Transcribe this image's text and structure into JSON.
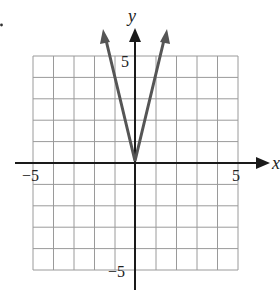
{
  "chart_data": {
    "type": "line",
    "title": "",
    "xlabel": "x",
    "ylabel": "y",
    "xlim": [
      -5,
      5
    ],
    "ylim": [
      -5,
      5
    ],
    "grid": true,
    "x_ticks": [
      {
        "value": -5,
        "label": "−5"
      },
      {
        "value": 5,
        "label": "5"
      }
    ],
    "y_ticks": [
      {
        "value": 5,
        "label": "5"
      },
      {
        "value": -5,
        "label": "−5"
      }
    ],
    "series": [
      {
        "name": "y = 4|x|",
        "points": [
          [
            -1.6,
            6.4
          ],
          [
            0,
            0
          ],
          [
            1.6,
            6.4
          ]
        ],
        "arrows": "both-ends-up"
      }
    ],
    "colors": {
      "grid": "#9a9a9a",
      "axis": "#1a1a1a",
      "series": "#555555"
    }
  },
  "labels": {
    "x_axis": "x",
    "y_axis": "y",
    "x_min": "−5",
    "x_max": "5",
    "y_max": "5",
    "y_min": "−5"
  }
}
